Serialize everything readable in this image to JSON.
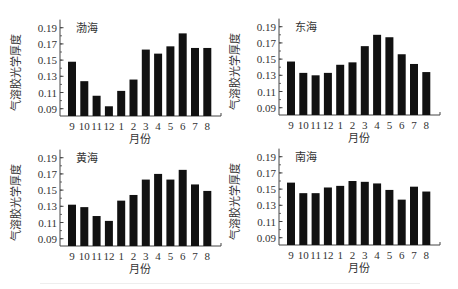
{
  "figure": {
    "panels_layout": "2x2",
    "bar_color": "#111111",
    "axis_color": "#444444",
    "text_color": "#333333"
  },
  "chart_data": [
    {
      "type": "bar",
      "title": "渤海",
      "xlabel": "月份",
      "ylabel": "气溶胶光学厚度",
      "categories": [
        "9",
        "10",
        "11",
        "12",
        "1",
        "2",
        "3",
        "4",
        "5",
        "6",
        "7",
        "8"
      ],
      "values": [
        0.148,
        0.124,
        0.106,
        0.093,
        0.112,
        0.126,
        0.163,
        0.158,
        0.167,
        0.183,
        0.165,
        0.165
      ],
      "yticks": [
        "0.09",
        "0.11",
        "0.13",
        "0.15",
        "0.17",
        "0.19"
      ],
      "ylim": [
        0.081,
        0.2
      ],
      "grid": false,
      "legend": null
    },
    {
      "type": "bar",
      "title": "东海",
      "xlabel": "月份",
      "ylabel": "气溶胶光学厚度",
      "categories": [
        "9",
        "10",
        "11",
        "12",
        "1",
        "2",
        "3",
        "4",
        "5",
        "6",
        "7",
        "8"
      ],
      "values": [
        0.147,
        0.133,
        0.13,
        0.133,
        0.143,
        0.146,
        0.166,
        0.18,
        0.177,
        0.156,
        0.144,
        0.134
      ],
      "yticks": [
        "0.09",
        "0.11",
        "0.13",
        "0.15",
        "0.17",
        "0.19"
      ],
      "ylim": [
        0.081,
        0.2
      ],
      "grid": false,
      "legend": null
    },
    {
      "type": "bar",
      "title": "黄海",
      "xlabel": "月份",
      "ylabel": "气溶胶光学厚度",
      "categories": [
        "9",
        "10",
        "11",
        "12",
        "1",
        "2",
        "3",
        "4",
        "5",
        "6",
        "7",
        "8"
      ],
      "values": [
        0.132,
        0.129,
        0.118,
        0.112,
        0.137,
        0.144,
        0.163,
        0.17,
        0.163,
        0.175,
        0.157,
        0.149
      ],
      "yticks": [
        "0.09",
        "0.11",
        "0.13",
        "0.15",
        "0.17",
        "0.19"
      ],
      "ylim": [
        0.081,
        0.2
      ],
      "grid": false,
      "legend": null
    },
    {
      "type": "bar",
      "title": "南海",
      "xlabel": "月份",
      "ylabel": "气溶胶光学厚度",
      "categories": [
        "9",
        "10",
        "11",
        "12",
        "1",
        "2",
        "3",
        "4",
        "5",
        "6",
        "7",
        "8"
      ],
      "values": [
        0.158,
        0.145,
        0.145,
        0.152,
        0.154,
        0.16,
        0.159,
        0.157,
        0.149,
        0.137,
        0.153,
        0.147
      ],
      "yticks": [
        "0.09",
        "0.11",
        "0.13",
        "0.15",
        "0.17",
        "0.19"
      ],
      "ylim": [
        0.081,
        0.2
      ],
      "grid": false,
      "legend": null
    }
  ]
}
